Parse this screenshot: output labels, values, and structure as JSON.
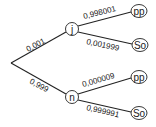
{
  "diagram": {
    "type": "probability-tree",
    "root": {
      "x": 11,
      "y": 63
    },
    "level1": [
      {
        "id": "j",
        "label": "j",
        "x": 72,
        "y": 29,
        "edge_label": "0,001"
      },
      {
        "id": "n",
        "label": "n",
        "x": 72,
        "y": 97,
        "edge_label": "0,999"
      }
    ],
    "level2": [
      {
        "parent": "j",
        "label": "pp",
        "x": 138,
        "y": 11,
        "edge_label": "0,998001"
      },
      {
        "parent": "j",
        "label": "So",
        "x": 139,
        "y": 45,
        "edge_label": "0,001999"
      },
      {
        "parent": "n",
        "label": "pp",
        "x": 138,
        "y": 77,
        "edge_label": "0,000009"
      },
      {
        "parent": "n",
        "label": "So",
        "x": 138,
        "y": 113,
        "edge_label": "0,999991"
      }
    ],
    "colors": {
      "line": "#222222",
      "background": "#ffffff"
    }
  }
}
